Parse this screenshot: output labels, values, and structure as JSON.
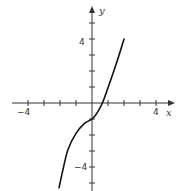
{
  "chart_data": {
    "type": "line",
    "title": "",
    "xlabel": "x",
    "ylabel": "y",
    "xlim": [
      -5,
      5
    ],
    "ylim": [
      -5.5,
      6
    ],
    "grid": false,
    "x_ticks": [
      -4,
      -3,
      -2,
      -1,
      1,
      2,
      3,
      4
    ],
    "y_ticks": [
      -5,
      -4,
      -3,
      -2,
      -1,
      1,
      2,
      3,
      4,
      5
    ],
    "x_tick_labels": [
      {
        "value": -4,
        "label": "−4"
      },
      {
        "value": 4,
        "label": "4"
      }
    ],
    "y_tick_labels": [
      {
        "value": 4,
        "label": "4"
      },
      {
        "value": -4,
        "label": "−4"
      }
    ],
    "series": [
      {
        "name": "f(x)",
        "color": "#111111",
        "x": [
          -2.06,
          -1.8,
          -1.5,
          -1.0,
          -0.5,
          0.0,
          0.3,
          0.65,
          1.0,
          1.5,
          2.0
        ],
        "y": [
          -5.3,
          -4.1,
          -2.9,
          -1.9,
          -1.3,
          -1.0,
          -0.65,
          0.0,
          0.95,
          2.4,
          4.0
        ]
      }
    ],
    "features": {
      "y_intercept": -1,
      "x_intercept": 0.65,
      "inflection_point": [
        0,
        -1
      ]
    }
  },
  "labels": {
    "x_axis": "x",
    "y_axis": "y",
    "x_neg4": "−4",
    "x_pos4": "4",
    "y_pos4": "4",
    "y_neg4": "−4"
  },
  "colors": {
    "axis": "#333333",
    "curve": "#111111",
    "background": "#ffffff"
  }
}
